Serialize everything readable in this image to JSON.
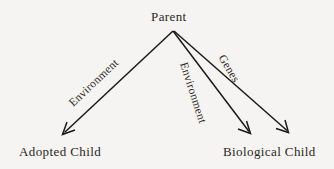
{
  "diagram": {
    "type": "path-diagram",
    "canvas": {
      "width": 334,
      "height": 169
    },
    "background_color": "#f5f4f2",
    "stroke_color": "#1c1a18",
    "text_color": "#2a2724",
    "nodes": [
      {
        "id": "parent",
        "label": "Parent",
        "x": 173,
        "y": 22
      },
      {
        "id": "adopted_child",
        "label": "Adopted Child",
        "x": 63,
        "y": 157
      },
      {
        "id": "biological_child",
        "label": "Biological Child",
        "x": 269,
        "y": 157
      }
    ],
    "edges": [
      {
        "id": "environment-adopted",
        "from": "parent",
        "to": "adopted_child",
        "label": "Environment",
        "rotation_deg": -43.5,
        "arrow": "open-v",
        "start": {
          "x": 173,
          "y": 31
        },
        "end": {
          "x": 63,
          "y": 134
        }
      },
      {
        "id": "environment-biological",
        "from": "parent",
        "to": "biological_child",
        "label": "Environment",
        "rotation_deg": 72,
        "arrow": "open-v",
        "start": {
          "x": 173,
          "y": 31
        },
        "end": {
          "x": 250,
          "y": 133
        }
      },
      {
        "id": "genes-biological",
        "from": "parent",
        "to": "biological_child",
        "label": "Genes",
        "rotation_deg": 59,
        "arrow": "open-v",
        "start": {
          "x": 174,
          "y": 31
        },
        "end": {
          "x": 288,
          "y": 132
        }
      }
    ]
  }
}
